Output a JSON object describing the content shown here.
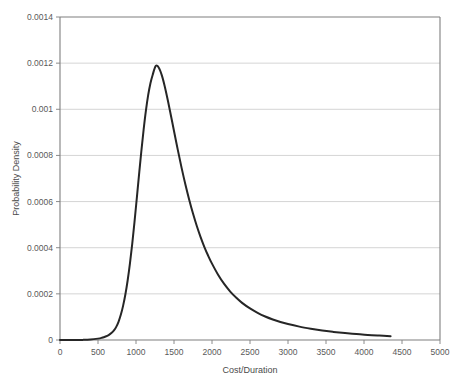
{
  "chart_data": {
    "type": "line",
    "title": "",
    "xlabel": "Cost/Duration",
    "ylabel": "Probability Density",
    "xlim": [
      0,
      5000
    ],
    "ylim": [
      0,
      0.0014
    ],
    "xticks": [
      0,
      500,
      1000,
      1500,
      2000,
      2500,
      3000,
      3500,
      4000,
      4500,
      5000
    ],
    "xtick_labels": [
      "0",
      "500",
      "1000",
      "1500",
      "2000",
      "2500",
      "3000",
      "3500",
      "4000",
      "4500",
      "5000"
    ],
    "yticks": [
      0,
      0.0002,
      0.0004,
      0.0006,
      0.0008,
      0.001,
      0.0012,
      0.0014
    ],
    "ytick_labels": [
      "0",
      "0.0002",
      "0.0004",
      "0.0006",
      "0.0008",
      "0.001",
      "0.0012",
      "0.0014"
    ],
    "grid": "horizontal",
    "legend": "none",
    "line_color": "#262626",
    "line_width": 2.0,
    "grid_color": "#c9c9c9",
    "frame_color": "#7f7f7f",
    "series": [
      {
        "name": "Probability Density",
        "x": [
          0,
          100,
          200,
          300,
          400,
          500,
          550,
          600,
          640,
          680,
          710,
          740,
          770,
          800,
          830,
          860,
          890,
          920,
          950,
          980,
          1010,
          1040,
          1070,
          1100,
          1130,
          1160,
          1190,
          1220,
          1260,
          1300,
          1340,
          1380,
          1420,
          1460,
          1500,
          1550,
          1600,
          1650,
          1700,
          1750,
          1800,
          1850,
          1900,
          1950,
          2000,
          2080,
          2160,
          2240,
          2320,
          2400,
          2500,
          2600,
          2700,
          2800,
          2900,
          3000,
          3150,
          3300,
          3450,
          3600,
          3750,
          3900,
          4050,
          4200,
          4350
        ],
        "y": [
          0.0,
          0.0,
          1e-07,
          5e-07,
          2e-06,
          6e-06,
          9.5e-06,
          1.5e-05,
          2.15e-05,
          3.1e-05,
          4.15e-05,
          5.7e-05,
          7.9e-05,
          0.000109,
          0.000148,
          0.000197,
          0.000258,
          0.000331,
          0.000416,
          0.000511,
          0.000613,
          0.000717,
          0.000818,
          0.000911,
          0.000993,
          0.001061,
          0.001113,
          0.00115,
          0.001188,
          0.00118,
          0.001147,
          0.001097,
          0.001037,
          0.000972,
          0.000906,
          0.000824,
          0.000746,
          0.000674,
          0.000608,
          0.000548,
          0.000494,
          0.000446,
          0.000403,
          0.000365,
          0.000331,
          0.000283,
          0.000243,
          0.00021,
          0.000183,
          0.00016,
          0.000137,
          0.000118,
          0.000102,
          8.9e-05,
          7.8e-05,
          6.9e-05,
          5.8e-05,
          4.9e-05,
          4.1e-05,
          3.5e-05,
          3e-05,
          2.6e-05,
          2.2e-05,
          1.9e-05,
          1.65e-05
        ]
      }
    ]
  },
  "plot_area": {
    "left": 60,
    "top": 17,
    "right": 440,
    "bottom": 340
  }
}
